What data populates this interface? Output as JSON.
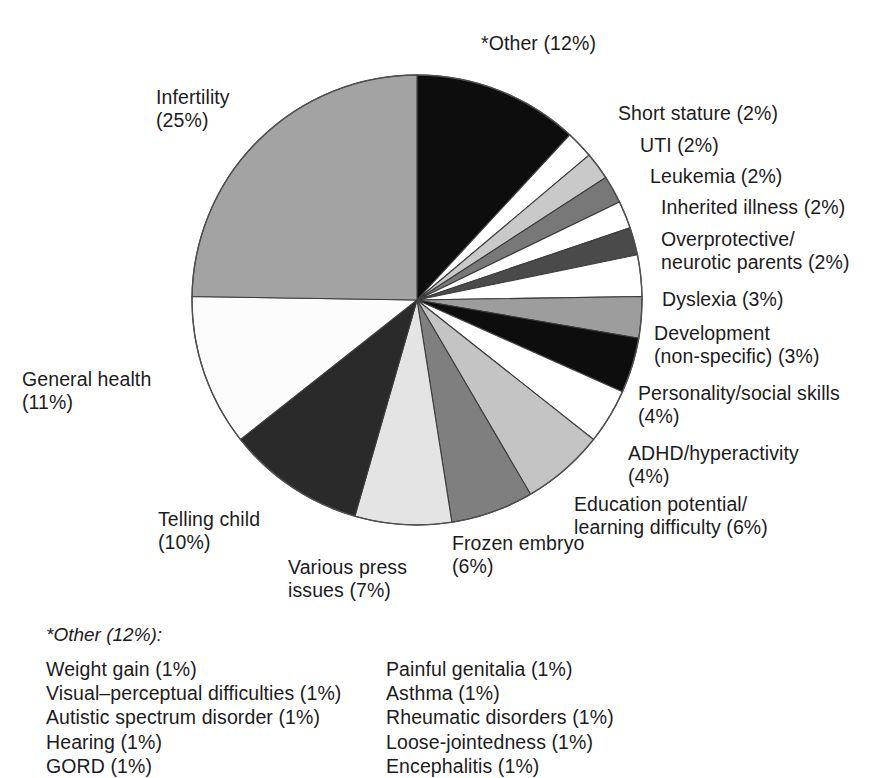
{
  "chart_data": {
    "type": "pie",
    "title": "",
    "legend_position": "callout-labels",
    "start_angle_deg": 0,
    "direction": "clockwise",
    "units": "percent",
    "categories": [
      "*Other",
      "Short stature",
      "UTI",
      "Leukemia",
      "Inherited illness",
      "Overprotective/ neurotic parents",
      "Dyslexia",
      "Development (non-specific)",
      "Personality/social skills",
      "ADHD/hyperactivity",
      "Education potential/ learning difficulty",
      "Frozen embryo",
      "Various press issues",
      "Telling child",
      "General health",
      "Infertility"
    ],
    "values": [
      12,
      2,
      2,
      2,
      2,
      2,
      3,
      3,
      4,
      4,
      6,
      6,
      7,
      10,
      11,
      25
    ],
    "slices": [
      {
        "name": "*Other",
        "value": 12,
        "color": "#0d0d0d"
      },
      {
        "name": "Short stature",
        "value": 2,
        "color": "#ffffff"
      },
      {
        "name": "UTI",
        "value": 2,
        "color": "#c9c9c9"
      },
      {
        "name": "Leukemia",
        "value": 2,
        "color": "#787878"
      },
      {
        "name": "Inherited illness",
        "value": 2,
        "color": "#ffffff"
      },
      {
        "name": "Overprotective/neurotic parents",
        "value": 2,
        "color": "#4a4a4a"
      },
      {
        "name": "Dyslexia",
        "value": 3,
        "color": "#ffffff"
      },
      {
        "name": "Development (non-specific)",
        "value": 3,
        "color": "#9d9d9d"
      },
      {
        "name": "Personality/social skills",
        "value": 4,
        "color": "#0d0d0d"
      },
      {
        "name": "ADHD/hyperactivity",
        "value": 4,
        "color": "#ffffff"
      },
      {
        "name": "Education potential/learning difficulty",
        "value": 6,
        "color": "#c4c4c4"
      },
      {
        "name": "Frozen embryo",
        "value": 6,
        "color": "#7f7f7f"
      },
      {
        "name": "Various press issues",
        "value": 7,
        "color": "#e4e4e4"
      },
      {
        "name": "Telling child",
        "value": 10,
        "color": "#2a2a2a"
      },
      {
        "name": "General health",
        "value": 11,
        "color": "#fcfcfc"
      },
      {
        "name": "Infertility",
        "value": 25,
        "color": "#a3a3a3"
      }
    ]
  },
  "labels": {
    "other": "*Other (12%)",
    "short_stature": "Short stature (2%)",
    "uti": "UTI (2%)",
    "leukemia": "Leukemia (2%)",
    "inherited_illness": "Inherited illness (2%)",
    "overprotective": "Overprotective/\nneurotic parents (2%)",
    "dyslexia": "Dyslexia (3%)",
    "development": "Development\n(non-specific) (3%)",
    "personality": "Personality/social skills\n(4%)",
    "adhd": "ADHD/hyperactivity\n(4%)",
    "education": "Education potential/\nlearning difficulty (6%)",
    "frozen_embryo": "Frozen embryo\n(6%)",
    "various_press": "Various press\nissues (7%)",
    "telling_child": "Telling child\n(10%)",
    "general_health": "General health\n(11%)",
    "infertility": "Infertility\n(25%)"
  },
  "other_detail": {
    "heading": "*Other (12%):",
    "left_column": [
      "Weight gain (1%)",
      "Visual–perceptual difficulties (1%)",
      "Autistic spectrum disorder (1%)",
      "Hearing (1%)",
      "GORD (1%)"
    ],
    "right_column": [
      "Painful genitalia (1%)",
      "Asthma (1%)",
      "Rheumatic disorders (1%)",
      "Loose-jointedness (1%)",
      "Encephalitis (1%)"
    ]
  }
}
